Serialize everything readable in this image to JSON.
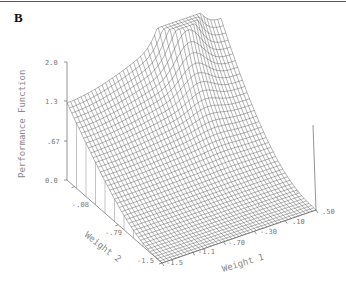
{
  "panel_label": "B",
  "chart_data": {
    "type": "surface3d",
    "title": "",
    "zlabel": "Performance Function",
    "xlabel": "Weight 1",
    "ylabel": "Weight 2",
    "z_ticks": [
      "0.0",
      ".67",
      "1.3",
      "2.0"
    ],
    "x_ticks": [
      "-1.5",
      "-1.1",
      "-.70",
      "-.30",
      ".10",
      ".50"
    ],
    "y_ticks": [
      "-1.5",
      "-.79",
      "-.08"
    ],
    "zlim": [
      0.0,
      2.0
    ],
    "xlim": [
      -1.5,
      0.5
    ],
    "ylim": [
      -1.5,
      0.6
    ],
    "grid": false,
    "key_points": [
      {
        "weight1": -1.5,
        "weight2": 0.6,
        "value": 1.3
      },
      {
        "weight1": 0.0,
        "weight2": 0.6,
        "value": 2.0
      },
      {
        "weight1": 0.5,
        "weight2": 0.6,
        "value": 0.9
      },
      {
        "weight1": 0.5,
        "weight2": -1.5,
        "value": 0.0
      },
      {
        "weight1": -1.5,
        "weight2": -1.5,
        "value": 0.0
      }
    ]
  }
}
